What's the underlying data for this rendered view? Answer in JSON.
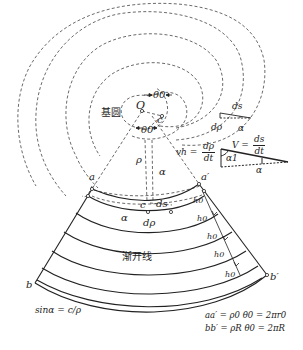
{
  "diagram": {
    "type": "involute spiral development diagram",
    "colors": {
      "line": "#222222",
      "dashed": "#444444",
      "background": "#ffffff"
    },
    "labels": {
      "base_circle": "基圆",
      "center": "O",
      "theta0_top": "θ0",
      "theta0_bottom": "θ0",
      "c_near_center": "c",
      "rho": "ρ",
      "alpha_mid": "α",
      "point_a": "a",
      "point_a_prime": "a′",
      "point_b": "b",
      "point_b_prime": "b′",
      "c_lower": "c",
      "ds_lower": "ds",
      "drho_lower": "dρ",
      "alpha_lower": "α",
      "involute": "渐开线",
      "h0_labels": [
        "h0",
        "h0",
        "h0",
        "h0",
        "h0",
        "h0"
      ]
    },
    "triangle_small": {
      "ds": "ds",
      "drho": "dρ",
      "alpha": "α"
    },
    "triangle_large": {
      "v_label": "V =",
      "v_num": "ds",
      "v_den": "dt",
      "vh_label": "vh =",
      "vh_num": "dρ",
      "vh_den": "dt",
      "alpha1": "α1",
      "alpha": "α"
    },
    "formulas": {
      "sin_alpha": "sinα = c/ρ",
      "aa_prime": "aa′ = ρ0 θ0 = 2πr0",
      "bb_prime": "bb′ = ρR θ0 = 2πR"
    }
  }
}
